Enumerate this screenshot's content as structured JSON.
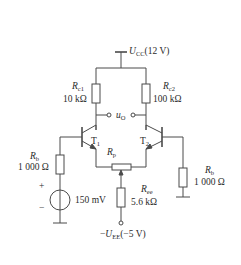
{
  "diagram": {
    "type": "differential-amplifier-circuit",
    "supply_positive": {
      "symbol": "U",
      "subscript": "CC",
      "value": "(12 V)"
    },
    "supply_negative": {
      "prefix": "−",
      "symbol": "U",
      "subscript": "EE",
      "value": "(−5 V)"
    },
    "output": {
      "symbol": "u",
      "subscript": "O"
    },
    "components": {
      "rc1": {
        "symbol": "R",
        "subscript": "c1",
        "value": "10 kΩ"
      },
      "rc2": {
        "symbol": "R",
        "subscript": "c2",
        "value": "100 kΩ"
      },
      "t1": {
        "symbol": "T",
        "subscript": "1"
      },
      "t2": {
        "symbol": "T",
        "subscript": "2"
      },
      "rp": {
        "symbol": "R",
        "subscript": "p"
      },
      "re": {
        "symbol": "R",
        "subscript": "ee",
        "value": "5.6 kΩ"
      },
      "rb_left": {
        "symbol": "R",
        "subscript": "b",
        "value": "1 000 Ω"
      },
      "rb_right": {
        "symbol": "R",
        "subscript": "b",
        "value": "1 000 Ω"
      },
      "source": {
        "value": "150 mV",
        "plus": "+",
        "minus": "−"
      }
    },
    "colors": {
      "line": "#4a4a4a",
      "text": "#2b2b2b",
      "background": "#ffffff"
    }
  }
}
